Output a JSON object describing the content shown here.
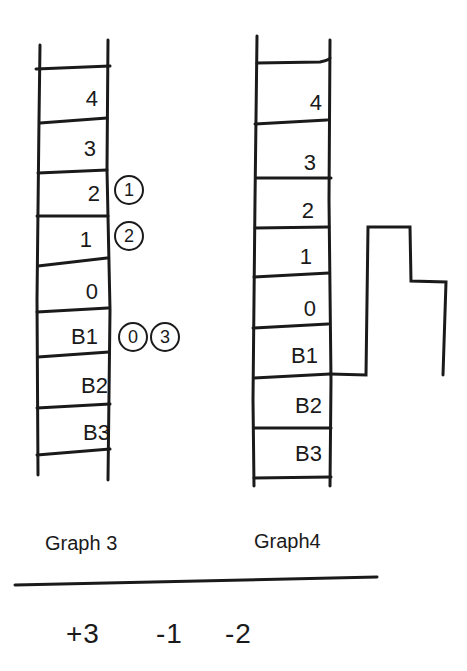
{
  "colors": {
    "ink": "#1a1a1a",
    "background": "#ffffff"
  },
  "graph3": {
    "caption": "Graph 3",
    "floors": [
      "4",
      "3",
      "2",
      "1",
      "0",
      "B1",
      "B2",
      "B3"
    ],
    "markers": [
      {
        "floor": "2",
        "circled": [
          "1"
        ]
      },
      {
        "floor": "1",
        "circled": [
          "2"
        ]
      },
      {
        "floor": "B1",
        "circled": [
          "0",
          "3"
        ]
      }
    ]
  },
  "graph4": {
    "caption": "Graph4",
    "floors": [
      "4",
      "3",
      "2",
      "1",
      "0",
      "B1",
      "B2",
      "B3"
    ],
    "step_path": "step graph rising from B1 level to above floor 1, stepping down one level, then dropping back to B1 level"
  },
  "changes": [
    "+3",
    "-1",
    "-2"
  ]
}
